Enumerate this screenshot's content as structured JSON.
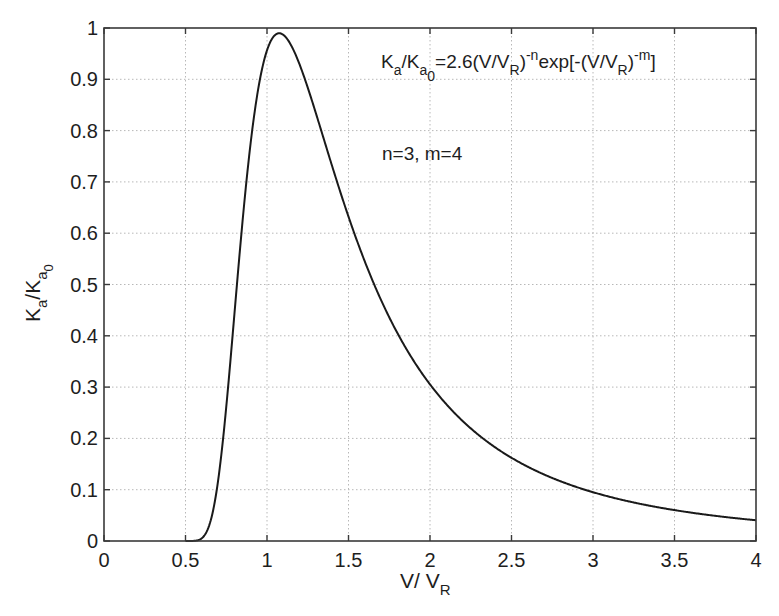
{
  "chart_data": {
    "type": "line",
    "title": "",
    "xlabel": "V/ V_R",
    "xlabel_main": "V/ V",
    "xlabel_sub": "R",
    "ylabel": "K_a/K_a0",
    "xlim": [
      0,
      4
    ],
    "ylim": [
      0,
      1
    ],
    "grid": true,
    "x_ticks": [
      0,
      0.5,
      1,
      1.5,
      2,
      2.5,
      3,
      3.5,
      4
    ],
    "x_tick_labels": [
      "0",
      "0.5",
      "1",
      "1.5",
      "2",
      "2.5",
      "3",
      "3.5",
      "4"
    ],
    "y_ticks": [
      0,
      0.1,
      0.2,
      0.3,
      0.4,
      0.5,
      0.6,
      0.7,
      0.8,
      0.9,
      1
    ],
    "y_tick_labels": [
      "0",
      "0.1",
      "0.2",
      "0.3",
      "0.4",
      "0.5",
      "0.6",
      "0.7",
      "0.8",
      "0.9",
      "1"
    ],
    "series": [
      {
        "name": "K_a/K_a0",
        "color": "#1a1a1a",
        "x": [
          0.5,
          0.6,
          0.7,
          0.8,
          0.9,
          1.0,
          1.075,
          1.1,
          1.2,
          1.3,
          1.4,
          1.5,
          1.75,
          2.0,
          2.5,
          3.0,
          3.5,
          4.0
        ],
        "y": [
          0.0,
          0.005,
          0.118,
          0.442,
          0.777,
          0.957,
          0.99,
          0.987,
          0.929,
          0.834,
          0.73,
          0.632,
          0.436,
          0.305,
          0.162,
          0.095,
          0.06,
          0.041
        ]
      }
    ],
    "formula": {
      "n": 3,
      "m": 4,
      "coef": 2.6
    },
    "annotations": [
      {
        "text": "K_a/K_a0 = 2.6(V/V_R)^-n exp[-(V/V_R)^-m]",
        "x": 1.85,
        "y": 0.915
      },
      {
        "text": "n=3, m=4",
        "x": 1.85,
        "y": 0.79
      }
    ]
  },
  "labels": {
    "formula_parts": {
      "K1": "K",
      "a1": "a",
      "slash": "/K",
      "a2": "a",
      "zero": "0",
      "eq": "=2.6(V/V",
      "R1": "R",
      "close1": ")",
      "exp_n": "-n",
      "exp": "exp[-(V/V",
      "R2": "R",
      "close2": ")",
      "exp_m": "-m",
      "bracket": "]"
    },
    "params": "n=3, m=4",
    "ylabel_parts": {
      "K1": "K",
      "a1": "a",
      "slash": "/K",
      "a2": "a",
      "zero": "0"
    }
  }
}
